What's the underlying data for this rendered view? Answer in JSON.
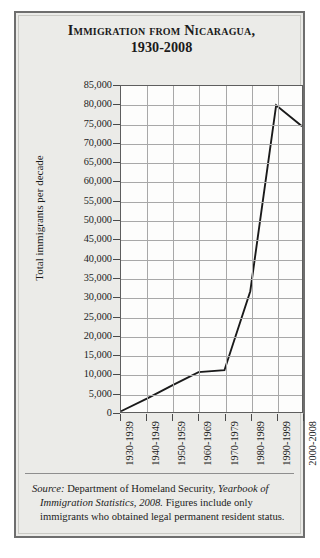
{
  "figure": {
    "title_line1": "Immigration from Nicaragua,",
    "title_line2": "1930-2008",
    "source_label": "Source:",
    "source_text_1": " Department of Homeland Security, ",
    "source_italic_2": "Yearbook of Immigration Statistics, 2008.",
    "source_text_3": " Figures include only immigrants who obtained legal permanent resident status."
  },
  "colors": {
    "panel_background": "#ebebe8",
    "panel_border": "#6e6e6e",
    "plot_background": "#fdfdfc",
    "gridline": "#a8a8a8",
    "axis": "#5e5e5e",
    "data_line": "#1a1a1a",
    "text": "#1b1b1b"
  },
  "chart_data": {
    "type": "line",
    "title": "Immigration from Nicaragua, 1930-2008",
    "xlabel": "",
    "ylabel": "Total immigrants per decade",
    "categories": [
      "1930-1939",
      "1940-1949",
      "1950-1959",
      "1960-1969",
      "1970-1979",
      "1980-1989",
      "1990-1999",
      "2000-2008"
    ],
    "values": [
      200,
      3500,
      7000,
      10400,
      10900,
      31500,
      80000,
      74500
    ],
    "ylim": [
      0,
      85000
    ],
    "ytick_step": 5000,
    "ytick_labels": [
      "85,000",
      "80,000",
      "75,000",
      "70,000",
      "65,000",
      "60,000",
      "55,000",
      "50,000",
      "45,000",
      "40,000",
      "35,000",
      "30,000",
      "25,000",
      "20,000",
      "15,000",
      "10,000",
      "5,000",
      "0"
    ],
    "ytick_values": [
      85000,
      80000,
      75000,
      70000,
      65000,
      60000,
      55000,
      50000,
      45000,
      40000,
      35000,
      30000,
      25000,
      20000,
      15000,
      10000,
      5000,
      0
    ],
    "grid": true,
    "legend": "none",
    "marker": "none"
  }
}
